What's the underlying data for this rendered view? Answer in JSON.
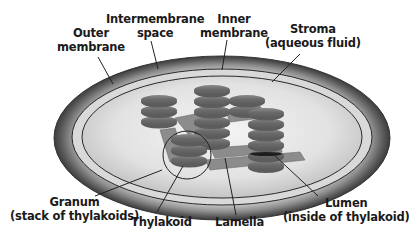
{
  "labels": {
    "outer_membrane": [
      "Outer",
      "membrane"
    ],
    "intermembrane_space": [
      "Intermembrane",
      "space"
    ],
    "inner_membrane": [
      "Inner",
      "membrane"
    ],
    "stroma": [
      "Stroma",
      "(aqueous fluid)"
    ],
    "granum": [
      "Granum",
      "(stack of thylakoids)"
    ],
    "thylakoid": [
      "Thylakoid"
    ],
    "lamella": [
      "Lamella"
    ],
    "lumen": [
      "Lumen",
      "(inside of thylakoid)"
    ]
  },
  "colors": {
    "outer_ring_dark": "#4a4a4a",
    "outer_ring_light": "#c8c8c8",
    "stroma_fill": "#e6e6e6",
    "thylakoid_fill": "#6e6e6e",
    "thylakoid_highlight": "#9a9a9a",
    "lamella_fill": "#8a8a8a",
    "line": "#222222"
  }
}
